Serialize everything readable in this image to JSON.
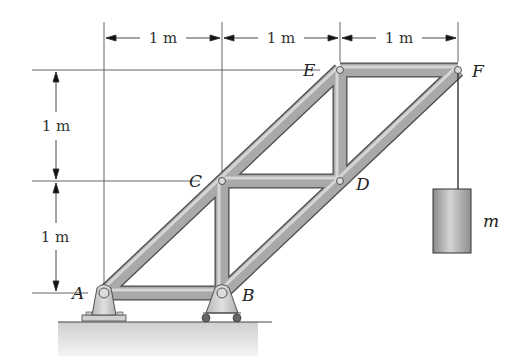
{
  "diagram": {
    "dimensions": {
      "horizontal": [
        {
          "label": "1 m",
          "from": "A",
          "to": "C"
        },
        {
          "label": "1 m",
          "from": "C",
          "to": "E"
        },
        {
          "label": "1 m",
          "from": "E",
          "to": "F"
        }
      ],
      "vertical": [
        {
          "label": "1 m",
          "from": "E",
          "to": "C"
        },
        {
          "label": "1 m",
          "from": "C",
          "to": "A"
        }
      ]
    },
    "joints": {
      "A": {
        "label": "A",
        "x": 104,
        "y": 293,
        "support": "pin"
      },
      "B": {
        "label": "B",
        "x": 222,
        "y": 293,
        "support": "roller"
      },
      "C": {
        "label": "C",
        "x": 222,
        "y": 181
      },
      "D": {
        "label": "D",
        "x": 340,
        "y": 181
      },
      "E": {
        "label": "E",
        "x": 340,
        "y": 70
      },
      "F": {
        "label": "F",
        "x": 458,
        "y": 70
      }
    },
    "members": [
      "AB",
      "AC",
      "BC",
      "BD",
      "CD",
      "CE",
      "DE",
      "DF",
      "EF"
    ],
    "load": {
      "label": "m",
      "hangs_from": "F"
    },
    "colors": {
      "member": "#a8a8a8",
      "member_edge": "#4a4a4a",
      "ground": "#d8d8d8",
      "mass": "#a0a0a0"
    }
  }
}
